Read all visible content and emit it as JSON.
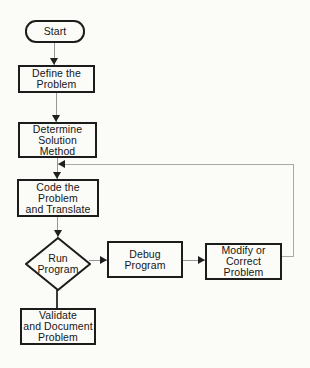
{
  "figure": {
    "type": "flowchart",
    "background": "#fbfbf8",
    "border_color": "#1c1c1c",
    "connector_color": "#979797",
    "feedback_line_color": "#a8a8a8",
    "arrowhead_color": "#1f1f1f",
    "text_color": "#161616"
  },
  "nodes": {
    "start": {
      "label": "Start",
      "shape": "terminator"
    },
    "define": {
      "label": "Define the\nProblem",
      "shape": "process"
    },
    "determine": {
      "label": "Determine\nSolution\nMethod",
      "shape": "process"
    },
    "code": {
      "label": "Code the\nProblem\nand Translate",
      "shape": "process"
    },
    "run": {
      "label": "Run\nProgram",
      "shape": "decision"
    },
    "debug": {
      "label": "Debug\nProgram",
      "shape": "process"
    },
    "modify": {
      "label": "Modify or\nCorrect\nProblem",
      "shape": "process"
    },
    "validate": {
      "label": "Validate\nand Document\nProblem",
      "shape": "process"
    }
  },
  "edges": [
    {
      "from": "start",
      "to": "define",
      "style": "arrow"
    },
    {
      "from": "define",
      "to": "determine",
      "style": "arrow"
    },
    {
      "from": "determine",
      "to": "code",
      "style": "arrow"
    },
    {
      "from": "code",
      "to": "run",
      "style": "arrow"
    },
    {
      "from": "run",
      "to": "debug",
      "style": "arrow"
    },
    {
      "from": "debug",
      "to": "modify",
      "style": "arrow"
    },
    {
      "from": "modify",
      "to": "code",
      "style": "arrow",
      "route": "feedback-loop-right-side"
    },
    {
      "from": "run",
      "to": "validate",
      "style": "plain"
    }
  ]
}
